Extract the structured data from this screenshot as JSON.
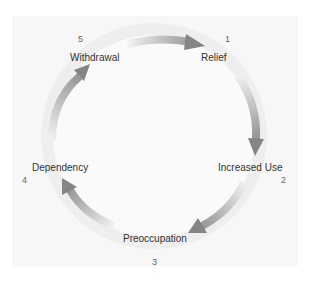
{
  "diagram": {
    "type": "cycle",
    "direction": "clockwise",
    "colors": {
      "background_panel": "#f7f7f7",
      "ring": "#eeeeee",
      "inner_circle": "#fafafa",
      "arrow_dark": "#8a8a8a",
      "arrow_light": "#f0f0f0",
      "label_text": "#333333",
      "number_text": "#666666"
    },
    "stages": [
      {
        "step": "1",
        "label": "Relief"
      },
      {
        "step": "2",
        "label": "Increased Use"
      },
      {
        "step": "3",
        "label": "Preoccupation"
      },
      {
        "step": "4",
        "label": "Dependency"
      },
      {
        "step": "5",
        "label": "Withdrawal"
      }
    ],
    "arrows": [
      {
        "from": "Withdrawal",
        "to": "Relief"
      },
      {
        "from": "Relief",
        "to": "Increased Use"
      },
      {
        "from": "Increased Use",
        "to": "Preoccupation"
      },
      {
        "from": "Preoccupation",
        "to": "Dependency"
      },
      {
        "from": "Dependency",
        "to": "Withdrawal"
      }
    ]
  }
}
